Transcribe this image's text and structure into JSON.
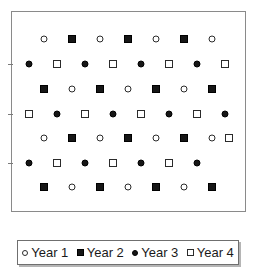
{
  "figure": {
    "title": "",
    "background_color": "#ffffff",
    "frame_color": "#8a8a8a"
  },
  "legend": {
    "position": "bottom",
    "entries": [
      {
        "label": "Year 1",
        "marker": "open-circle",
        "marker_name": "open-circle-icon",
        "color": "#ffffff"
      },
      {
        "label": "Year 2",
        "marker": "filled-square",
        "marker_name": "filled-square-icon",
        "color": "#161616"
      },
      {
        "label": "Year 3",
        "marker": "filled-circle",
        "marker_name": "filled-circle-icon",
        "color": "#161616"
      },
      {
        "label": "Year 4",
        "marker": "open-square",
        "marker_name": "open-square-icon",
        "color": "#ffffff"
      }
    ]
  },
  "chart_data": {
    "type": "scatter",
    "title": "",
    "xlabel": "",
    "ylabel": "",
    "xlim": [
      0,
      235
    ],
    "ylim": [
      0,
      201
    ],
    "grid": false,
    "legend_position": "bottom",
    "axis_ticks": {
      "left_tick_y": [
        52,
        102,
        151
      ],
      "left_tick_count": 3,
      "bottom_tick_count": 0,
      "tick_labels": []
    },
    "series": [
      {
        "name": "Year 1",
        "marker": "open-circle",
        "points": [
          {
            "x": 32,
            "y": 27
          },
          {
            "x": 88,
            "y": 27
          },
          {
            "x": 144,
            "y": 27
          },
          {
            "x": 200,
            "y": 27
          },
          {
            "x": 60,
            "y": 77
          },
          {
            "x": 116,
            "y": 77
          },
          {
            "x": 172,
            "y": 77
          },
          {
            "x": 32,
            "y": 126
          },
          {
            "x": 88,
            "y": 126
          },
          {
            "x": 144,
            "y": 126
          },
          {
            "x": 200,
            "y": 126
          },
          {
            "x": 60,
            "y": 175
          },
          {
            "x": 116,
            "y": 175
          },
          {
            "x": 172,
            "y": 175
          }
        ]
      },
      {
        "name": "Year 2",
        "marker": "filled-square",
        "points": [
          {
            "x": 60,
            "y": 27
          },
          {
            "x": 116,
            "y": 27
          },
          {
            "x": 172,
            "y": 27
          },
          {
            "x": 32,
            "y": 77
          },
          {
            "x": 88,
            "y": 77
          },
          {
            "x": 144,
            "y": 77
          },
          {
            "x": 200,
            "y": 77
          },
          {
            "x": 60,
            "y": 126
          },
          {
            "x": 116,
            "y": 126
          },
          {
            "x": 172,
            "y": 126
          },
          {
            "x": 32,
            "y": 175
          },
          {
            "x": 88,
            "y": 175
          },
          {
            "x": 144,
            "y": 175
          },
          {
            "x": 200,
            "y": 175
          }
        ]
      },
      {
        "name": "Year 3",
        "marker": "filled-circle",
        "points": [
          {
            "x": 17,
            "y": 52
          },
          {
            "x": 73,
            "y": 52
          },
          {
            "x": 129,
            "y": 52
          },
          {
            "x": 185,
            "y": 52
          },
          {
            "x": 45,
            "y": 102
          },
          {
            "x": 101,
            "y": 102
          },
          {
            "x": 157,
            "y": 102
          },
          {
            "x": 213,
            "y": 102
          },
          {
            "x": 17,
            "y": 151
          },
          {
            "x": 73,
            "y": 151
          },
          {
            "x": 129,
            "y": 151
          },
          {
            "x": 185,
            "y": 151
          }
        ]
      },
      {
        "name": "Year 4",
        "marker": "open-square",
        "points": [
          {
            "x": 45,
            "y": 52
          },
          {
            "x": 101,
            "y": 52
          },
          {
            "x": 157,
            "y": 52
          },
          {
            "x": 213,
            "y": 52
          },
          {
            "x": 17,
            "y": 102
          },
          {
            "x": 73,
            "y": 102
          },
          {
            "x": 129,
            "y": 102
          },
          {
            "x": 185,
            "y": 102
          },
          {
            "x": 217,
            "y": 126
          },
          {
            "x": 45,
            "y": 151
          },
          {
            "x": 101,
            "y": 151
          },
          {
            "x": 157,
            "y": 151
          }
        ]
      }
    ]
  }
}
